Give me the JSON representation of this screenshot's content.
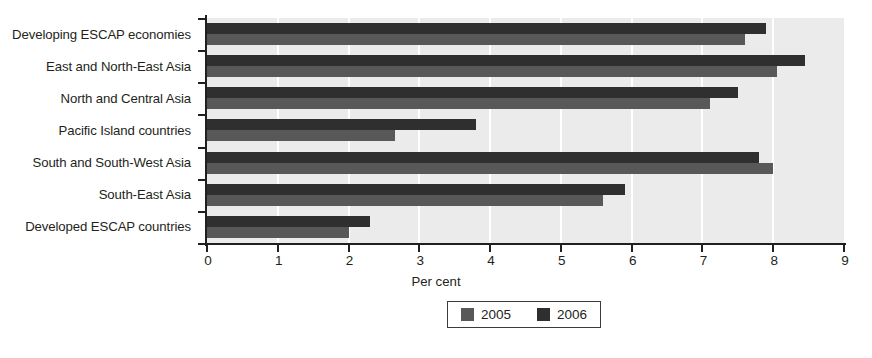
{
  "chart_data": {
    "type": "bar",
    "orientation": "horizontal",
    "title": "",
    "xlabel": "Per cent",
    "ylabel": "",
    "xlim": [
      0,
      9
    ],
    "xticks": [
      "0",
      "1",
      "2",
      "3",
      "4",
      "5",
      "6",
      "7",
      "8",
      "9"
    ],
    "grid": true,
    "grid_axis": "x",
    "legend_position": "bottom-center",
    "categories": [
      "Developing ESCAP economies",
      "East and North-East Asia",
      "North and Central Asia",
      "Pacific Island countries",
      "South and South-West Asia",
      "South-East Asia",
      "Developed ESCAP countries"
    ],
    "series": [
      {
        "name": "2005",
        "color": "#585858",
        "values": [
          7.6,
          8.05,
          7.1,
          2.65,
          8.0,
          5.6,
          2.0
        ]
      },
      {
        "name": "2006",
        "color": "#2f2f2f",
        "values": [
          7.9,
          8.45,
          7.5,
          3.8,
          7.8,
          5.9,
          2.3
        ]
      }
    ]
  },
  "legend": {
    "items": [
      {
        "label": "2005",
        "color": "#585858"
      },
      {
        "label": "2006",
        "color": "#2f2f2f"
      }
    ]
  },
  "colors": {
    "plot_background": "#ebebeb",
    "gridline": "#ffffff",
    "axis": "#231f20",
    "text": "#231f20",
    "series_2005": "#585858",
    "series_2006": "#2f2f2f"
  }
}
